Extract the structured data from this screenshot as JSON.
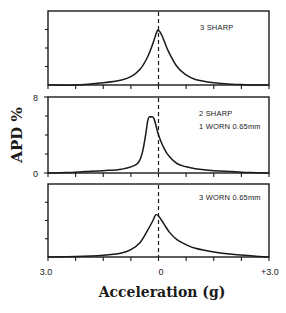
{
  "chart_data": {
    "type": "line",
    "layout": "3 vertically stacked panels sharing x-axis",
    "xlabel": "Acceleration (g)",
    "ylabel": "APD %",
    "xlim": [
      -3.0,
      3.0
    ],
    "ylim": [
      0,
      8
    ],
    "x_tick_labels": [
      "3.0",
      "0",
      "+3.0"
    ],
    "y_tick_labels": [
      "8",
      "0"
    ],
    "grid": false,
    "reference_line": {
      "x": 0,
      "style": "dashed"
    },
    "panels": [
      {
        "annotation": [
          "3 SHARP"
        ],
        "series": {
          "name": "3 SHARP",
          "x": [
            -3.0,
            -2.25,
            -1.5,
            -1.0,
            -0.75,
            -0.5,
            -0.3,
            -0.15,
            -0.05,
            0.0,
            0.1,
            0.25,
            0.5,
            0.75,
            1.0,
            1.5,
            2.0,
            2.25,
            2.5,
            3.0
          ],
          "y": [
            0.0,
            0.0,
            0.25,
            0.55,
            0.9,
            1.7,
            3.0,
            4.5,
            5.7,
            5.9,
            5.3,
            3.8,
            2.0,
            1.1,
            0.6,
            0.25,
            0.08,
            0.05,
            0.0,
            0.0
          ]
        }
      },
      {
        "annotation": [
          "2 SHARP",
          "1 WORN 0.65mm"
        ],
        "series": {
          "name": "2 SHARP, 1 WORN 0.65mm",
          "x": [
            -3.0,
            -2.5,
            -2.0,
            -1.5,
            -1.0,
            -0.6,
            -0.45,
            -0.35,
            -0.28,
            -0.2,
            -0.12,
            0.0,
            0.15,
            0.3,
            0.5,
            0.75,
            1.0,
            1.5,
            2.0,
            2.5,
            3.0
          ],
          "y": [
            0.0,
            0.05,
            0.15,
            0.25,
            0.4,
            0.9,
            2.0,
            4.0,
            5.7,
            5.9,
            5.7,
            4.0,
            2.6,
            1.7,
            1.0,
            0.65,
            0.45,
            0.25,
            0.15,
            0.05,
            0.0
          ]
        }
      },
      {
        "annotation": [
          "3 WORN 0.65mm"
        ],
        "series": {
          "name": "3 WORN 0.65mm",
          "x": [
            -3.0,
            -2.25,
            -1.5,
            -1.0,
            -0.75,
            -0.5,
            -0.3,
            -0.15,
            -0.08,
            0.0,
            0.15,
            0.3,
            0.5,
            0.75,
            1.0,
            1.5,
            2.0,
            2.5,
            2.75,
            3.0
          ],
          "y": [
            0.0,
            0.05,
            0.2,
            0.45,
            0.8,
            1.6,
            2.9,
            4.0,
            4.6,
            4.5,
            3.6,
            2.7,
            1.9,
            1.35,
            0.95,
            0.55,
            0.3,
            0.15,
            0.05,
            0.0
          ]
        }
      }
    ]
  },
  "labels": {
    "ylabel": "APD %",
    "xlabel": "Acceleration (g)",
    "x_left": "3.0",
    "x_center": "0",
    "x_right": "+3.0",
    "y_top": "8",
    "y_bottom": "0",
    "panel1_line1": "3 SHARP",
    "panel2_line1": "2 SHARP",
    "panel2_line2": "1 WORN 0.65mm",
    "panel3_line1": "3 WORN 0.65mm"
  }
}
